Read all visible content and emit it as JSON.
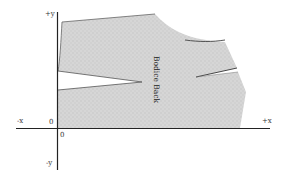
{
  "diagram": {
    "type": "pattern-piece-on-axes",
    "piece_label": "Bodice Back",
    "axes": {
      "plus_y": "+y",
      "minus_y": "-y",
      "plus_x": "+x",
      "minus_x": "-x",
      "origin_y_label": "0",
      "origin_x_label": "0"
    },
    "colors": {
      "fill": "#d4d4d4",
      "outline": "#555555",
      "axis": "#222222",
      "background": "#ffffff"
    },
    "darts": [
      {
        "name": "waist-dart",
        "side": "left"
      },
      {
        "name": "shoulder-dart",
        "side": "right"
      }
    ]
  }
}
